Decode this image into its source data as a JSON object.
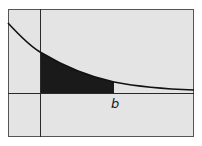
{
  "diagram": {
    "labels": {
      "b_marker": "b"
    },
    "colors": {
      "background": "#e4e4e4",
      "frame": "#555555",
      "axes": "#2a2a2a",
      "curve": "#111111",
      "shaded_region": "#1a1a1a"
    },
    "geometry": {
      "frame": {
        "x": 8,
        "y": 9,
        "w": 186,
        "h": 128
      },
      "y_axis_x": 40,
      "x_axis_y": 93,
      "b_x": 114
    }
  }
}
